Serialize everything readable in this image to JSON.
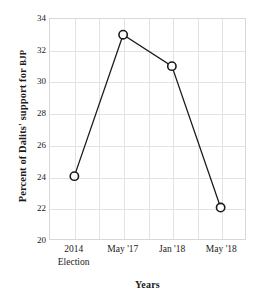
{
  "chart_data": {
    "type": "line",
    "title": "",
    "subtitle": "",
    "xlabel": "Years",
    "ylabel_full": "Percent of Dalits' support for BJP",
    "ylabel_main": "Percent of Dalits' support for ",
    "ylabel_smallcaps": "BJP",
    "categories": [
      "2014 Election",
      "May '17",
      "Jan '18",
      "May '18"
    ],
    "category_lines": [
      [
        "2014",
        "Election"
      ],
      [
        "May '17",
        ""
      ],
      [
        "Jan '18",
        ""
      ],
      [
        "May '18",
        ""
      ]
    ],
    "values": [
      24,
      33,
      31,
      22
    ],
    "series": [
      {
        "name": "Percent of Dalits' support for BJP",
        "values": [
          24,
          33,
          31,
          22
        ]
      }
    ],
    "ylim": [
      20,
      34
    ],
    "yticks": [
      20,
      22,
      24,
      26,
      28,
      30,
      32,
      34
    ],
    "ytick_labels": [
      "20",
      "22",
      "24",
      "26",
      "28",
      "30",
      "32",
      "34"
    ],
    "xticks": [
      0,
      1,
      2,
      3
    ],
    "grid": true,
    "legend": false,
    "legend_position": "none",
    "marker": "open-circle",
    "line_color": "#1a1a1a",
    "marker_fill": "#ffffff",
    "marker_stroke": "#1a1a1a",
    "grid_color": "#e3e3e3",
    "background_color": "#ffffff",
    "annotations": []
  }
}
